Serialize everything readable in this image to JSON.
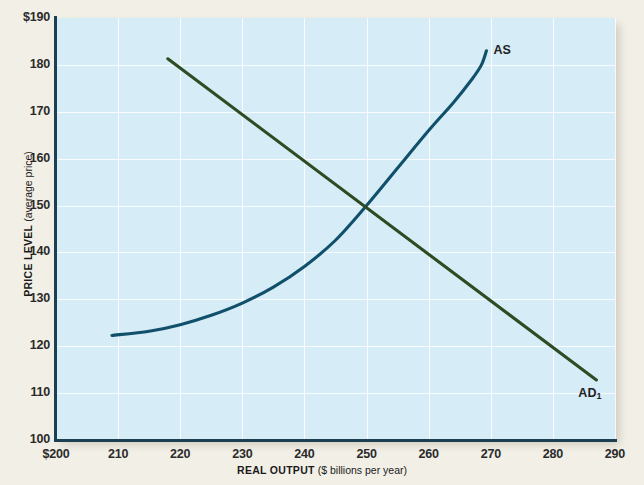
{
  "chart_data": {
    "type": "line",
    "title": "",
    "xlabel_strong": "REAL OUTPUT",
    "xlabel_light": "($ billions per year)",
    "ylabel_strong": "PRICE LEVEL",
    "ylabel_light": "(average price)",
    "xlim": [
      200,
      290
    ],
    "ylim": [
      100,
      190
    ],
    "grid": true,
    "legend_position": "inline-labels",
    "x_ticks": [
      "$200",
      "210",
      "220",
      "230",
      "240",
      "250",
      "260",
      "270",
      "280",
      "290"
    ],
    "x_tick_values": [
      200,
      210,
      220,
      230,
      240,
      250,
      260,
      270,
      280,
      290
    ],
    "y_ticks": [
      "100",
      "110",
      "120",
      "130",
      "140",
      "150",
      "160",
      "170",
      "180",
      "$190"
    ],
    "y_tick_values": [
      100,
      110,
      120,
      130,
      140,
      150,
      160,
      170,
      180,
      190
    ],
    "series": [
      {
        "name": "AS",
        "label": "AS",
        "label_sub": "",
        "color": "#11506b",
        "kind": "aggregate-supply",
        "points": [
          [
            209.0,
            122.3
          ],
          [
            215.0,
            123.2
          ],
          [
            220.0,
            124.6
          ],
          [
            225.0,
            126.6
          ],
          [
            230.0,
            129.2
          ],
          [
            235.0,
            132.6
          ],
          [
            240.0,
            137.0
          ],
          [
            245.0,
            142.6
          ],
          [
            250.0,
            150.0
          ],
          [
            255.0,
            158.0
          ],
          [
            260.0,
            166.0
          ],
          [
            264.0,
            172.0
          ],
          [
            267.0,
            177.0
          ],
          [
            268.5,
            180.0
          ],
          [
            269.3,
            183.0
          ]
        ]
      },
      {
        "name": "AD1",
        "label": "AD",
        "label_sub": "1",
        "color": "#2f4b24",
        "kind": "aggregate-demand",
        "points": [
          [
            218.0,
            181.3
          ],
          [
            287.0,
            112.8
          ]
        ]
      }
    ],
    "equilibrium": {
      "x": 250,
      "y": 150
    },
    "colors": {
      "plot_background": "#d6ecf7",
      "page_background": "#f2efe6",
      "gridline": "#ffffff",
      "axis": "#1d3f52",
      "as_curve": "#11506b",
      "ad_curve": "#2f4b24"
    }
  }
}
